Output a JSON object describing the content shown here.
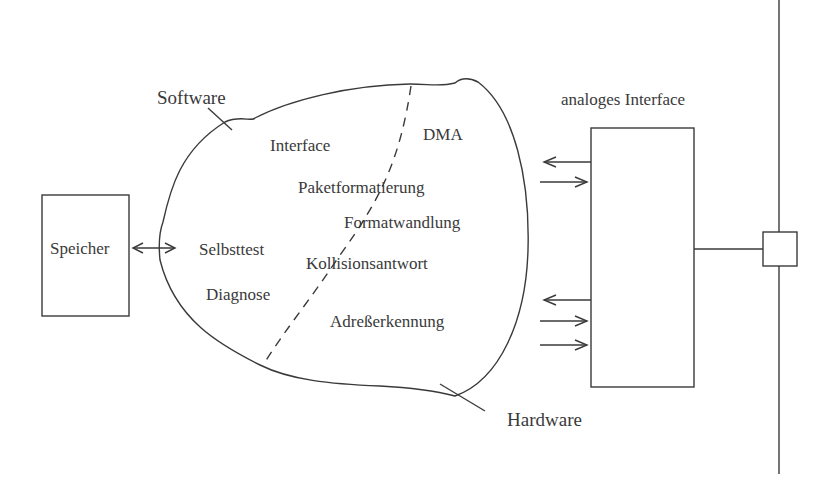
{
  "diagram": {
    "labels": {
      "software": "Software",
      "hardware": "Hardware",
      "speicher": "Speicher",
      "analog_interface": "analoges Interface"
    },
    "software_functions": [
      {
        "text": "Interface"
      },
      {
        "text": "Selbsttest"
      },
      {
        "text": "Diagnose"
      }
    ],
    "hardware_functions": [
      {
        "text": "DMA"
      }
    ],
    "boundary_functions": [
      {
        "text": "Paketformatierung"
      },
      {
        "text": "Formatwandlung"
      },
      {
        "text": "Kollisionsantwort"
      },
      {
        "text": "Adreßerkennung"
      }
    ],
    "colors": {
      "line": "#3a3a3a",
      "text": "#3a3a3a",
      "background": "#ffffff"
    }
  }
}
